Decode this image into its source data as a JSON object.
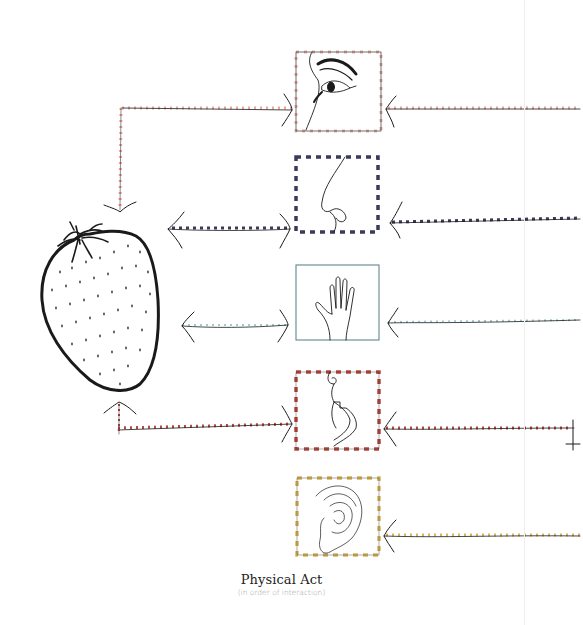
{
  "caption": {
    "title": "Physical Act",
    "subtitle": "(in order of interaction)"
  },
  "object": {
    "name": "strawberry",
    "icon": "strawberry-icon"
  },
  "senses": [
    {
      "id": "sight",
      "icon": "eye-icon",
      "color": "#e8a89a",
      "dash": "light",
      "order": 1
    },
    {
      "id": "smell",
      "icon": "nose-icon",
      "color": "#3a3a5a",
      "dash": "heavy",
      "order": 2
    },
    {
      "id": "touch",
      "icon": "hand-icon",
      "color": "#8fbcc4",
      "dash": "none",
      "order": 3
    },
    {
      "id": "taste",
      "icon": "mouth-icon",
      "color": "#b5483f",
      "dash": "heavy",
      "order": 4
    },
    {
      "id": "hearing",
      "icon": "ear-icon",
      "color": "#d9b45a",
      "dash": "heavy",
      "order": 5
    }
  ],
  "colors": {
    "ink": "#1a1a1a",
    "background": "#ffffff",
    "divider": "#efefef"
  }
}
